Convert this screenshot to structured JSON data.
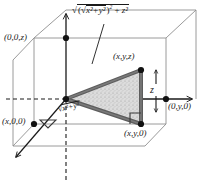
{
  "figure": {
    "kind": "hand-drawn geometry illustration",
    "background_color": "#ffffff",
    "ink_color": "#1a1a1a",
    "triangle_edge_color": "#5d5d5d",
    "triangle_fill_color": "#cfcfcf"
  },
  "labels": {
    "hypotenuse_expr_prefix": "√(",
    "point_z_axis": "(0,0,z)",
    "point_x_axis": "(x,0,0)",
    "point_y_axis": "(0,y,0)",
    "point_xyz": "(x,y,z)",
    "point_xy0": "(x,y,0)",
    "vertical_leg": "z",
    "base_leg_radical": "√",
    "base_leg_radicand": "x²+y²",
    "hyp_outer_radical": "√",
    "hyp_inner_radical": "√",
    "hyp_inner_radicand": "x²+y²",
    "hyp_inner_power": "2",
    "hyp_plus": "+",
    "hyp_zsq": "z²"
  },
  "geometry": {
    "origin": [
      66,
      99
    ],
    "vertex_xyz": [
      141,
      70
    ],
    "vertex_xy0": [
      141,
      124
    ],
    "z_axis_top": [
      66,
      10
    ],
    "y_axis_right": [
      196,
      99
    ],
    "x_axis_arrow": [
      13,
      160
    ],
    "box_top_left": [
      34,
      38
    ],
    "box_top_right": [
      166,
      38
    ],
    "box_bottom_left": [
      34,
      124
    ],
    "box_bottom_right": [
      166,
      124
    ]
  },
  "annotations": {
    "right_angle_at_xy0": true,
    "right_angle_at_x00": true,
    "dashed_diagonal_origin_to_xyz": true,
    "leader_line_to_hypotenuse": true,
    "double_arrow_z_measure": true
  }
}
